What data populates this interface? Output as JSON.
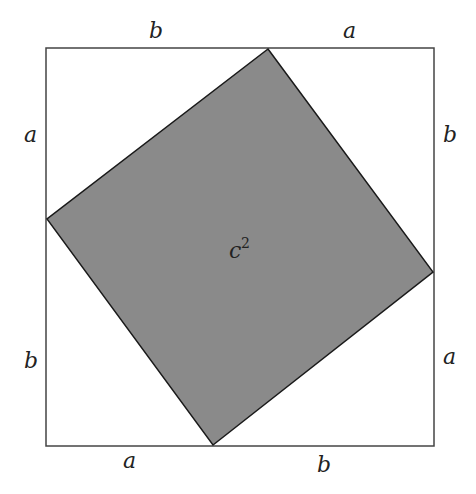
{
  "diagram": {
    "colors": {
      "background": "#ffffff",
      "outer_stroke": "#444444",
      "inner_fill": "#8a8a8a",
      "inner_stroke": "#1a1a1a",
      "text": "#222222"
    },
    "outer_square": {
      "x": 46,
      "y": 48,
      "width": 388,
      "height": 398
    },
    "inner_square_points": "268,49 433,272 213,445 47,219",
    "center_label": {
      "base": "c",
      "exponent": "2"
    },
    "labels": {
      "top_left": "b",
      "top_right": "a",
      "left_upper": "a",
      "left_lower": "b",
      "right_upper": "b",
      "right_lower": "a",
      "bottom_left": "a",
      "bottom_right": "b"
    }
  }
}
